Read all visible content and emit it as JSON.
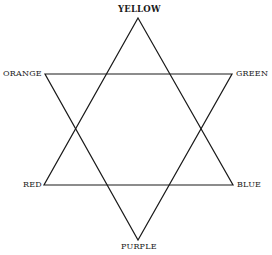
{
  "diagram": {
    "stroke_color": "#1a1a1a",
    "background": "#ffffff",
    "vertices": {
      "yellow": {
        "label": "YELLOW",
        "x": 138,
        "y": 18
      },
      "green": {
        "label": "GREEN",
        "x": 232,
        "y": 74
      },
      "blue": {
        "label": "BLUE",
        "x": 233,
        "y": 185
      },
      "purple": {
        "label": "PURPLE",
        "x": 138,
        "y": 240
      },
      "red": {
        "label": "RED",
        "x": 44,
        "y": 185
      },
      "orange": {
        "label": "ORANGE",
        "x": 45,
        "y": 74
      }
    },
    "triangles": [
      {
        "name": "primary-triangle",
        "points": [
          "yellow",
          "blue",
          "red"
        ]
      },
      {
        "name": "secondary-triangle",
        "points": [
          "orange",
          "green",
          "purple"
        ]
      }
    ]
  }
}
